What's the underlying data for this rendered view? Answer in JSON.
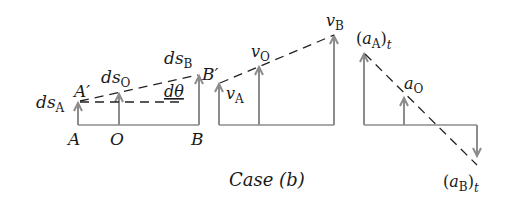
{
  "figure": {
    "caption": "Case (b)",
    "colors": {
      "vector": "#8c8c8c",
      "dashed": "#222222",
      "text": "#1a1a1a",
      "background": "#ffffff"
    },
    "panel_displacement": {
      "points": [
        "A",
        "O",
        "B"
      ],
      "displaced_points": [
        "A′",
        "B′"
      ],
      "vectors": [
        {
          "base": "ds",
          "sub": "A"
        },
        {
          "base": "ds",
          "sub": "O"
        },
        {
          "base": "ds",
          "sub": "B"
        }
      ],
      "angle_label": "dθ"
    },
    "panel_velocity": {
      "vectors": [
        {
          "base": "v",
          "sub": "A"
        },
        {
          "base": "v",
          "sub": "O"
        },
        {
          "base": "v",
          "sub": "B"
        }
      ]
    },
    "panel_acceleration": {
      "vectors": [
        {
          "open": "(",
          "base": "a",
          "sub": "A",
          "close": ")",
          "post": "t"
        },
        {
          "base": "a",
          "sub": "O"
        },
        {
          "open": "(",
          "base": "a",
          "sub": "B",
          "close": ")",
          "post": "t"
        }
      ]
    }
  }
}
